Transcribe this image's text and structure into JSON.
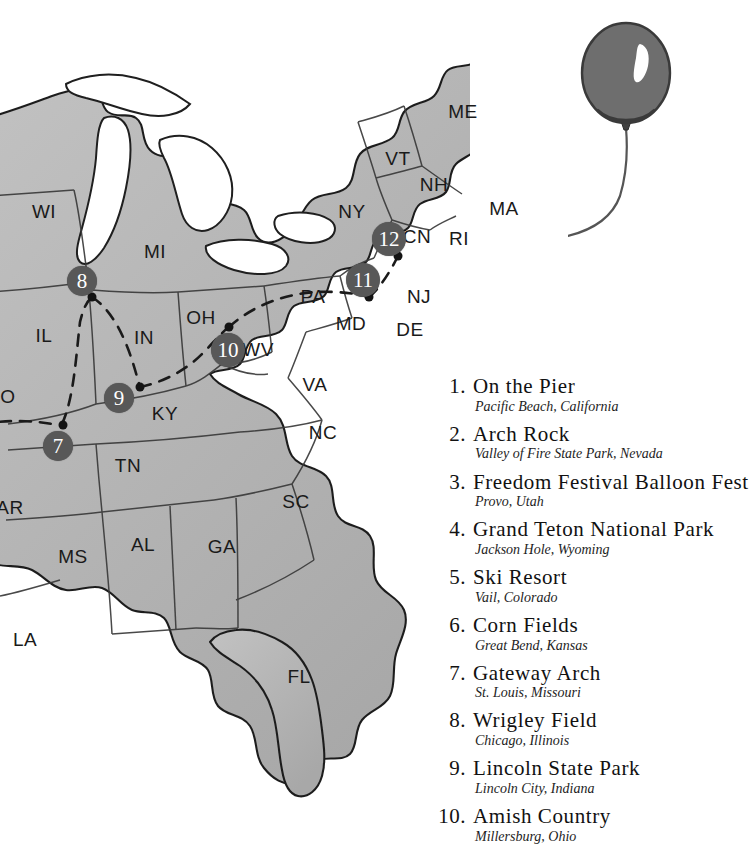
{
  "map": {
    "title": "United States travel map",
    "land_color": "#b6b6b6",
    "outline_color": "#1f1f1f",
    "marker_color": "#585858",
    "marker_text_color": "#ffffff",
    "background_color": "#ffffff",
    "state_labels": [
      {
        "abbr": "WI",
        "x": 44,
        "y": 212
      },
      {
        "abbr": "MI",
        "x": 155,
        "y": 252
      },
      {
        "abbr": "ME",
        "x": 463,
        "y": 112
      },
      {
        "abbr": "VT",
        "x": 398,
        "y": 159
      },
      {
        "abbr": "NH",
        "x": 434,
        "y": 185
      },
      {
        "abbr": "MA",
        "x": 504,
        "y": 209
      },
      {
        "abbr": "NY",
        "x": 352,
        "y": 212
      },
      {
        "abbr": "CN",
        "x": 417,
        "y": 237
      },
      {
        "abbr": "RI",
        "x": 459,
        "y": 239
      },
      {
        "abbr": "IL",
        "x": 44,
        "y": 336
      },
      {
        "abbr": "IN",
        "x": 144,
        "y": 338
      },
      {
        "abbr": "OH",
        "x": 201,
        "y": 318
      },
      {
        "abbr": "PA",
        "x": 313,
        "y": 297
      },
      {
        "abbr": "NJ",
        "x": 419,
        "y": 297
      },
      {
        "abbr": "MD",
        "x": 351,
        "y": 324
      },
      {
        "abbr": "DE",
        "x": 410,
        "y": 330
      },
      {
        "abbr": "WV",
        "x": 258,
        "y": 350
      },
      {
        "abbr": "VA",
        "x": 315,
        "y": 385
      },
      {
        "abbr": "O",
        "x": 8,
        "y": 397
      },
      {
        "abbr": "KY",
        "x": 165,
        "y": 414
      },
      {
        "abbr": "NC",
        "x": 323,
        "y": 433
      },
      {
        "abbr": "TN",
        "x": 128,
        "y": 466
      },
      {
        "abbr": "AR",
        "x": 10,
        "y": 508
      },
      {
        "abbr": "SC",
        "x": 296,
        "y": 502
      },
      {
        "abbr": "MS",
        "x": 73,
        "y": 557
      },
      {
        "abbr": "AL",
        "x": 143,
        "y": 545
      },
      {
        "abbr": "GA",
        "x": 222,
        "y": 547
      },
      {
        "abbr": "LA",
        "x": 25,
        "y": 640
      },
      {
        "abbr": "FL",
        "x": 299,
        "y": 677
      }
    ],
    "markers": [
      {
        "number": "7",
        "x": 58,
        "y": 446,
        "dot_x": 63,
        "dot_y": 425
      },
      {
        "number": "8",
        "x": 82,
        "y": 281,
        "dot_x": 92,
        "dot_y": 297
      },
      {
        "number": "9",
        "x": 119,
        "y": 398,
        "dot_x": 140,
        "dot_y": 387
      },
      {
        "number": "10",
        "x": 228,
        "y": 350,
        "dot_x": 229,
        "dot_y": 327
      },
      {
        "number": "11",
        "x": 363,
        "y": 280,
        "dot_x": 369,
        "dot_y": 297
      },
      {
        "number": "12",
        "x": 389,
        "y": 239,
        "dot_x": 398,
        "dot_y": 256
      }
    ]
  },
  "balloon": {
    "name": "hot air balloon illustration",
    "body_color": "#6e6e6e",
    "outline_color": "#3a3a3a",
    "highlight_color": "#ffffff",
    "string_color": "#555555"
  },
  "legend": {
    "items": [
      {
        "number": "1.",
        "title": "On the Pier",
        "location": "Pacific Beach, California"
      },
      {
        "number": "2.",
        "title": "Arch Rock",
        "location": "Valley of Fire State Park, Nevada"
      },
      {
        "number": "3.",
        "title": "Freedom Festival Balloon Fest",
        "location": "Provo, Utah"
      },
      {
        "number": "4.",
        "title": "Grand Teton National Park",
        "location": "Jackson Hole, Wyoming"
      },
      {
        "number": "5.",
        "title": "Ski Resort",
        "location": "Vail, Colorado"
      },
      {
        "number": "6.",
        "title": "Corn Fields",
        "location": "Great Bend, Kansas"
      },
      {
        "number": "7.",
        "title": "Gateway Arch",
        "location": "St. Louis, Missouri"
      },
      {
        "number": "8.",
        "title": "Wrigley Field",
        "location": "Chicago, Illinois"
      },
      {
        "number": "9.",
        "title": "Lincoln State Park",
        "location": "Lincoln City, Indiana"
      },
      {
        "number": "10.",
        "title": "Amish Country",
        "location": "Millersburg, Ohio"
      }
    ]
  }
}
